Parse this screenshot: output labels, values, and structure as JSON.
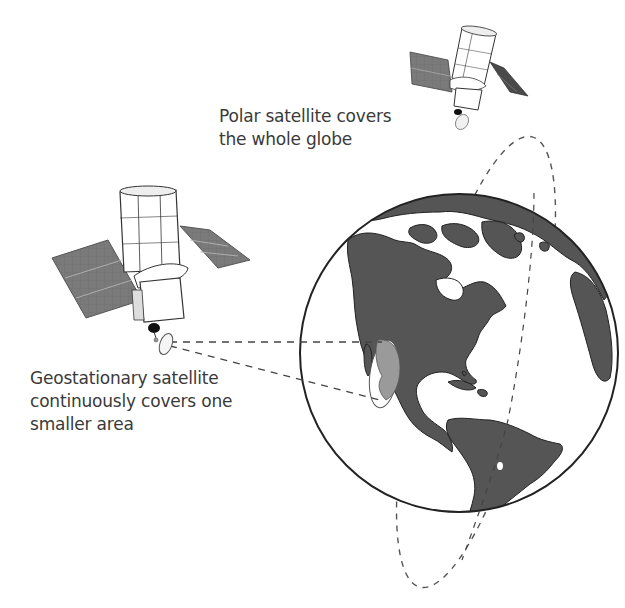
{
  "labels": {
    "polar": {
      "line1": "Polar satellite covers",
      "line2": "the whole globe"
    },
    "geostationary": {
      "line1": "Geostationary satellite",
      "line2": "continuously covers one",
      "line3": "smaller area"
    }
  },
  "colors": {
    "background": "#ffffff",
    "land": "#555555",
    "ocean": "#ffffff",
    "outline": "#222222",
    "coverage_area": "#9a9a9a",
    "solar_panel": "#7a7a7a",
    "dashed_line": "#555555",
    "text": "#3a3a3a"
  },
  "elements": {
    "globe": "Earth (Americas view)",
    "polar_satellite": "satellite on polar orbit, top right",
    "geostationary_satellite": "satellite, left",
    "polar_orbit": "dashed elliptical orbit around globe",
    "coverage_beam": "dashed lines from geostationary dish to coverage ellipse"
  }
}
